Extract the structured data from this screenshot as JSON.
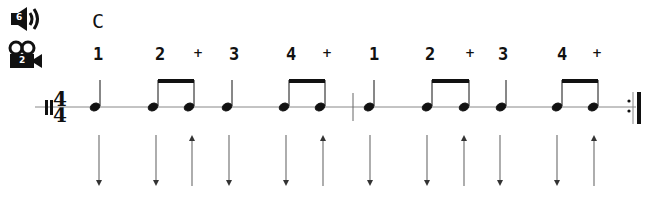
{
  "toolbar": {
    "audio_button": {
      "icon": "speaker-icon",
      "badge": "6"
    },
    "video_button": {
      "icon": "video-camera-icon",
      "badge": "2"
    }
  },
  "chord": "C",
  "time_signature": {
    "top": "4",
    "bottom": "4"
  },
  "measures": [
    {
      "counts": [
        {
          "label": "1",
          "x": 98,
          "type": "beat"
        },
        {
          "label": "2",
          "x": 160,
          "type": "beat"
        },
        {
          "label": "+",
          "x": 198,
          "type": "and"
        },
        {
          "label": "3",
          "x": 234,
          "type": "beat"
        },
        {
          "label": "4",
          "x": 291,
          "type": "beat"
        },
        {
          "label": "+",
          "x": 327,
          "type": "and"
        }
      ]
    },
    {
      "counts": [
        {
          "label": "1",
          "x": 374,
          "type": "beat"
        },
        {
          "label": "2",
          "x": 430,
          "type": "beat"
        },
        {
          "label": "+",
          "x": 470,
          "type": "and"
        },
        {
          "label": "3",
          "x": 503,
          "type": "beat"
        },
        {
          "label": "4",
          "x": 562,
          "type": "beat"
        },
        {
          "label": "+",
          "x": 597,
          "type": "and"
        }
      ]
    }
  ],
  "strum_pattern": [
    "down",
    "down",
    "up",
    "down",
    "down",
    "up",
    "down",
    "down",
    "up",
    "down",
    "down",
    "up"
  ],
  "colors": {
    "ink": "#111111",
    "staff": "#888888",
    "arrow": "#777777"
  }
}
